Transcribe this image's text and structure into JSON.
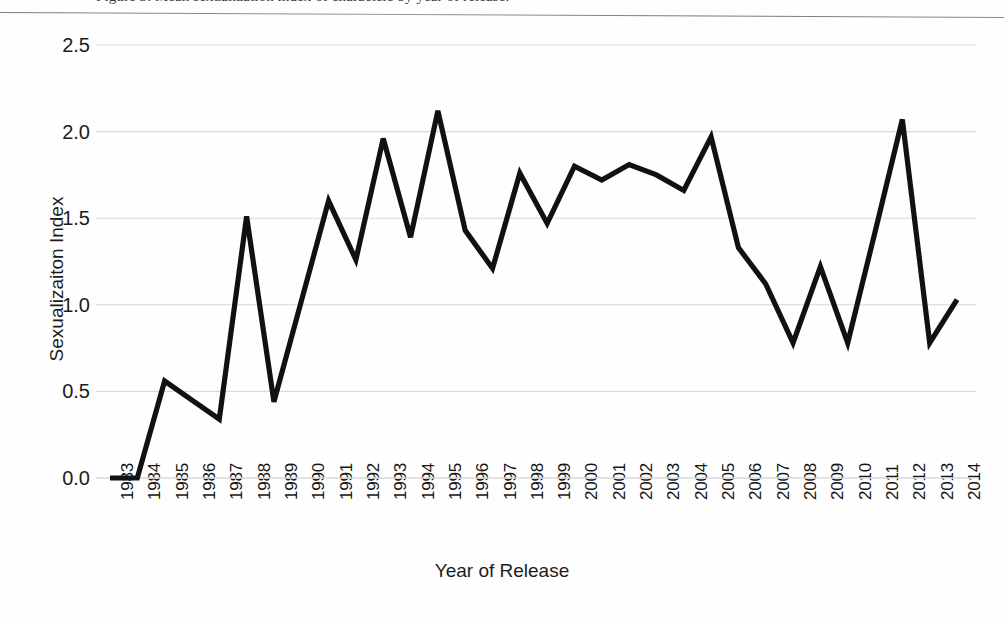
{
  "page": {
    "caption_fragment": "Figure 3. Mean sexualization index of characters by year of release.",
    "background_color": "#ffffff",
    "line_color": "#111111",
    "gridline_color": "#d9d9d9"
  },
  "chart_data": {
    "type": "line",
    "title": "",
    "xlabel": "Year of Release",
    "ylabel": "Sexualizaiton Index",
    "grid": true,
    "legend": "none",
    "xlim": [
      1983,
      2014
    ],
    "ylim": [
      0.0,
      2.5
    ],
    "yticks": [
      "0.0",
      "0.5",
      "1.0",
      "1.5",
      "2.0",
      "2.5"
    ],
    "ytick_values": [
      0.0,
      0.5,
      1.0,
      1.5,
      2.0,
      2.5
    ],
    "categories": [
      "1983",
      "1984",
      "1985",
      "1986",
      "1987",
      "1988",
      "1989",
      "1990",
      "1991",
      "1992",
      "1993",
      "1994",
      "1995",
      "1996",
      "1997",
      "1998",
      "1999",
      "2000",
      "2001",
      "2002",
      "2003",
      "2004",
      "2005",
      "2006",
      "2007",
      "2008",
      "2009",
      "2010",
      "2011",
      "2012",
      "2013",
      "2014"
    ],
    "x": [
      1983,
      1984,
      1985,
      1986,
      1987,
      1988,
      1989,
      1990,
      1991,
      1992,
      1993,
      1994,
      1995,
      1996,
      1997,
      1998,
      1999,
      2000,
      2001,
      2002,
      2003,
      2004,
      2005,
      2006,
      2007,
      2008,
      2009,
      2010,
      2011,
      2012,
      2013,
      2014
    ],
    "series": [
      {
        "name": "Sexualizaiton Index",
        "values": [
          0.0,
          0.0,
          0.56,
          0.45,
          0.34,
          1.51,
          0.44,
          1.02,
          1.6,
          1.26,
          1.96,
          1.39,
          2.12,
          1.43,
          1.21,
          1.76,
          1.47,
          1.8,
          1.72,
          1.81,
          1.75,
          1.66,
          1.97,
          1.33,
          1.12,
          0.78,
          1.22,
          0.78,
          1.42,
          2.07,
          0.78,
          1.03
        ]
      }
    ]
  }
}
